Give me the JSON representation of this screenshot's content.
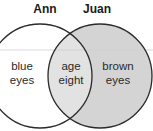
{
  "diagram": {
    "type": "venn",
    "sets": [
      {
        "name": "Ann",
        "fill": "#ffffff"
      },
      {
        "name": "Juan",
        "fill": "#d4d4d4"
      }
    ],
    "regions": {
      "ann_only": [
        "blue",
        "eyes"
      ],
      "both": [
        "age",
        "eight"
      ],
      "juan_only": [
        "brown",
        "eyes"
      ]
    },
    "colors": {
      "outline": "#2b2b2b",
      "intersection_fill": "#e2e2e2",
      "juan_fill": "#d4d4d4",
      "guide_line": "#cfcfcf"
    }
  }
}
